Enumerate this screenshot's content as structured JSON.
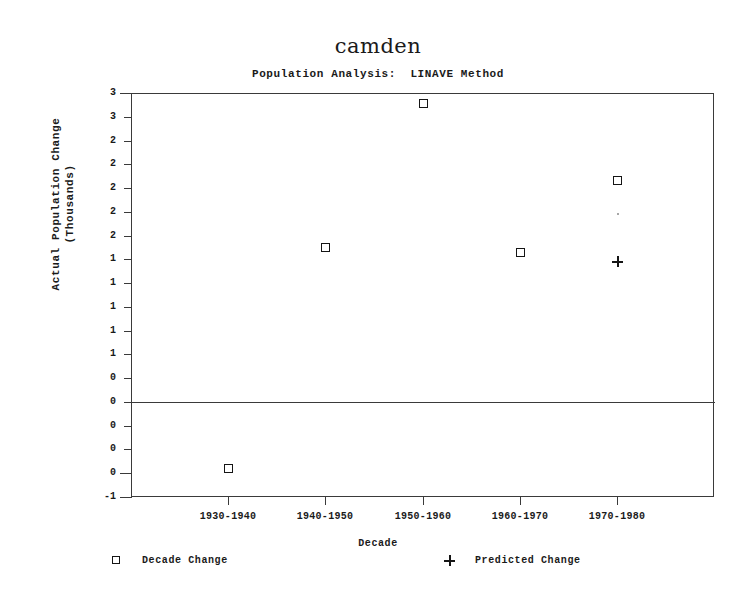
{
  "chart_data": {
    "type": "scatter",
    "title": "camden",
    "subtitle": "Population Analysis:  LINAVE Method",
    "xlabel": "Decade",
    "ylabel": "Actual Population Change\n(Thousands)",
    "categories": [
      "1930-1940",
      "1940-1950",
      "1950-1960",
      "1960-1970",
      "1970-1980"
    ],
    "series": [
      {
        "name": "Decade Change",
        "marker": "square",
        "values": [
          -0.7,
          1.6,
          3.1,
          1.55,
          2.3
        ]
      },
      {
        "name": "Predicted Change",
        "marker": "plus",
        "values": [
          null,
          null,
          null,
          null,
          1.45
        ]
      }
    ],
    "ylim": [
      -1.0,
      3.2
    ],
    "ytick_values": [
      3.2,
      3.0,
      2.8,
      2.6,
      2.4,
      2.2,
      2.0,
      1.8,
      1.6,
      1.4,
      1.2,
      1.0,
      0.8,
      0.6,
      0.4,
      0.2,
      0.0,
      -1.0
    ],
    "ytick_labels": [
      "3",
      "3",
      "2",
      "2",
      "2",
      "2",
      "2",
      "1",
      "1",
      "1",
      "1",
      "1",
      "0",
      "0",
      "0",
      "0",
      "0",
      "-1"
    ],
    "zero_reference": 0.0,
    "grid": false,
    "legend_position": "below-axes",
    "legend": [
      {
        "symbol": "square",
        "label": "Decade Change"
      },
      {
        "symbol": "plus",
        "label": "Predicted Change"
      }
    ],
    "annotations": [
      {
        "type": "faint-dot",
        "x_category": "1970-1980",
        "y": 1.95
      }
    ]
  }
}
